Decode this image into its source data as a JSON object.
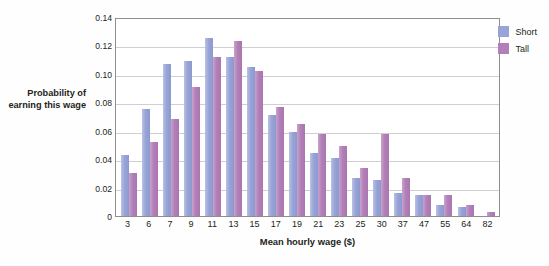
{
  "chart_data": {
    "type": "bar",
    "title": "",
    "xlabel": "Mean hourly wage ($)",
    "ylabel": "Probability of earning this wage",
    "categories": [
      "3",
      "6",
      "7",
      "9",
      "11",
      "13",
      "15",
      "17",
      "19",
      "21",
      "23",
      "25",
      "30",
      "37",
      "47",
      "55",
      "64",
      "82"
    ],
    "ylim": [
      0,
      0.14
    ],
    "yticks": [
      "0.14",
      "0.12",
      "0.10",
      "0.08",
      "0.06",
      "0.04",
      "0.02",
      "0"
    ],
    "ytick_values": [
      0.14,
      0.12,
      0.1,
      0.08,
      0.06,
      0.04,
      0.02,
      0
    ],
    "grid": true,
    "legend_position": "top-right",
    "series": [
      {
        "name": "Short",
        "color": "#98a4d6",
        "values": [
          0.043,
          0.075,
          0.107,
          0.109,
          0.125,
          0.112,
          0.105,
          0.071,
          0.059,
          0.044,
          0.041,
          0.027,
          0.025,
          0.016,
          0.015,
          0.008,
          0.006,
          0.0
        ]
      },
      {
        "name": "Tall",
        "color": "#b37fb8",
        "values": [
          0.03,
          0.052,
          0.068,
          0.091,
          0.112,
          0.123,
          0.102,
          0.077,
          0.065,
          0.058,
          0.049,
          0.034,
          0.058,
          0.027,
          0.015,
          0.015,
          0.008,
          0.003
        ]
      }
    ]
  },
  "legend": {
    "items": [
      {
        "label": "Short",
        "key": "short"
      },
      {
        "label": "Tall",
        "key": "tall"
      }
    ]
  }
}
